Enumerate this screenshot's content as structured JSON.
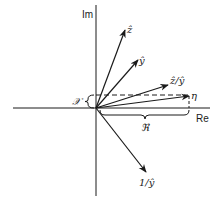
{
  "diagram": {
    "title": "",
    "axes": {
      "real_label": "Re",
      "imag_label": "Im"
    },
    "origin": [
      96,
      108
    ],
    "vectors": [
      {
        "name": "z-hat",
        "label": "ẑ",
        "tip": [
          125,
          30
        ]
      },
      {
        "name": "y-hat",
        "label": "ŷ",
        "tip": [
          138,
          60
        ]
      },
      {
        "name": "z-over-y",
        "label": "ẑ/ŷ",
        "tip": [
          168,
          85
        ]
      },
      {
        "name": "eta",
        "label": "η",
        "tip": [
          190,
          96
        ]
      },
      {
        "name": "one-over-y",
        "label": "1/ŷ",
        "tip": [
          146,
          172
        ]
      }
    ],
    "annotations": {
      "reactance_label": "𝒳",
      "resistance_label": "ℜ"
    },
    "colors": {
      "ink": "#1a1a1a",
      "background": "#ffffff"
    }
  }
}
